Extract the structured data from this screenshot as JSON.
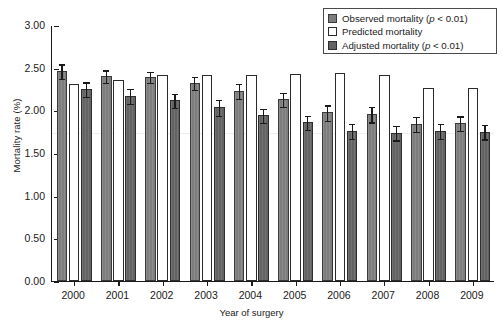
{
  "chart_data": {
    "type": "bar",
    "title": "",
    "xlabel": "Year of surgery",
    "ylabel": "Mortality rate (%)",
    "ylim": [
      0.0,
      3.0
    ],
    "ytick_labels": [
      "0.00",
      "0.50",
      "1.00",
      "1.50",
      "2.00",
      "2.50",
      "3.00"
    ],
    "ytick_values": [
      0.0,
      0.5,
      1.0,
      1.5,
      2.0,
      2.5,
      3.0
    ],
    "grid": false,
    "legend_position": "top-right",
    "categories": [
      "2000",
      "2001",
      "2002",
      "2003",
      "2004",
      "2005",
      "2006",
      "2007",
      "2008",
      "2009"
    ],
    "series": [
      {
        "name": "Observed mortality (p < 0.01)",
        "key": "observed",
        "color": "#7d7d7d",
        "values": [
          2.46,
          2.4,
          2.39,
          2.32,
          2.23,
          2.13,
          1.98,
          1.96,
          1.84,
          1.85
        ],
        "err_low": [
          2.38,
          2.33,
          2.33,
          2.25,
          2.15,
          2.05,
          1.89,
          1.87,
          1.76,
          1.77
        ],
        "err_high": [
          2.55,
          2.48,
          2.46,
          2.4,
          2.32,
          2.22,
          2.07,
          2.05,
          1.93,
          1.94
        ]
      },
      {
        "name": "Predicted mortality",
        "key": "predicted",
        "color": "#ffffff",
        "values": [
          2.31,
          2.36,
          2.41,
          2.41,
          2.41,
          2.43,
          2.44,
          2.42,
          2.26,
          2.26
        ],
        "err_low": [
          null,
          null,
          null,
          null,
          null,
          null,
          null,
          null,
          null,
          null
        ],
        "err_high": [
          null,
          null,
          null,
          null,
          null,
          null,
          null,
          null,
          null,
          null
        ]
      },
      {
        "name": "Adjusted mortality (p < 0.01)",
        "key": "adjusted",
        "color": "#636363",
        "values": [
          2.25,
          2.17,
          2.12,
          2.04,
          1.94,
          1.86,
          1.76,
          1.74,
          1.76,
          1.75
        ],
        "err_low": [
          2.17,
          2.09,
          2.04,
          1.95,
          1.86,
          1.78,
          1.68,
          1.66,
          1.68,
          1.67
        ],
        "err_high": [
          2.34,
          2.26,
          2.2,
          2.13,
          2.03,
          1.95,
          1.85,
          1.83,
          1.85,
          1.84
        ]
      }
    ]
  },
  "legend": {
    "items": [
      {
        "label_main": "Observed mortality (",
        "p_italic": "p",
        "label_tail": " < 0.01)",
        "swatch": "observed-swatch"
      },
      {
        "label_main": "Predicted mortality",
        "p_italic": "",
        "label_tail": "",
        "swatch": "predicted-swatch"
      },
      {
        "label_main": "Adjusted mortality (",
        "p_italic": "p",
        "label_tail": " < 0.01)",
        "swatch": "adjusted-swatch"
      }
    ]
  },
  "colors": {
    "observed": "#7d7d7d",
    "predicted": "#ffffff",
    "adjusted": "#636363",
    "axis": "#1a1a1a",
    "background": "#ffffff"
  }
}
